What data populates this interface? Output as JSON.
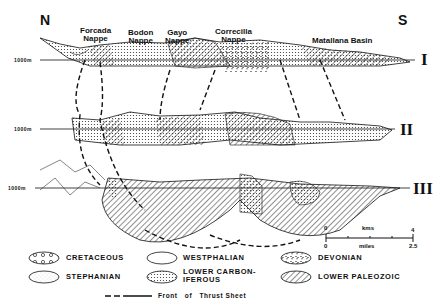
{
  "compass": {
    "north": "N",
    "south": "S"
  },
  "units": {
    "zero_km": "0",
    "km_label": "kms",
    "km_max": "4",
    "zero_mi": "0",
    "mi_label": "miles",
    "mi_max": "2.5"
  },
  "nappes": [
    {
      "line1": "Forcada",
      "line2": "Nappe"
    },
    {
      "line1": "Bodon",
      "line2": "Nappe"
    },
    {
      "line1": "Gayo",
      "line2": "Nappe"
    },
    {
      "line1": "Correcilla",
      "line2": "Nappe"
    }
  ],
  "basin": "Matallana Basin",
  "sections": [
    {
      "numeral": "I",
      "elevation": "1000m"
    },
    {
      "numeral": "II",
      "elevation": "1000m"
    },
    {
      "numeral": "III",
      "elevation": "1000m"
    }
  ],
  "legend": {
    "items": [
      {
        "label": "CRETACEOUS",
        "pattern": "circles"
      },
      {
        "label": "WESTPHALIAN",
        "pattern": "blank"
      },
      {
        "label": "DEVONIAN",
        "pattern": "mottled"
      },
      {
        "label": "STEPHANIAN",
        "pattern": "fine-stipple"
      },
      {
        "label": "LOWER CARBON-\nIFEROUS",
        "pattern": "dots"
      },
      {
        "label": "LOWER PALEOZOIC",
        "pattern": "hatch"
      }
    ],
    "thrust_front": "Front   of   Thrust Sheet"
  },
  "colors": {
    "ink": "#111111",
    "paper": "#ffffff"
  }
}
